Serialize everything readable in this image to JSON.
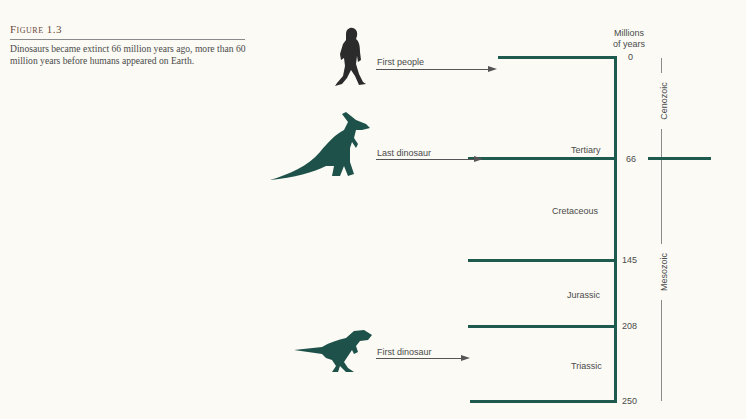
{
  "caption": {
    "title": "Figure 1.3",
    "text": "Dinosaurs became extinct 66 million years ago, more than 60 million years  before humans appeared on Earth."
  },
  "axis": {
    "title_line1": "Millions",
    "title_line2": "of years",
    "ticks": [
      "0",
      "66",
      "145",
      "208",
      "250"
    ]
  },
  "periods": [
    {
      "name": "Tertiary"
    },
    {
      "name": "Cretaceous"
    },
    {
      "name": "Jurassic"
    },
    {
      "name": "Triassic"
    }
  ],
  "eras": [
    {
      "name": "Cenozoic"
    },
    {
      "name": "Mesozoic"
    }
  ],
  "events": [
    {
      "label": "First people",
      "icon": "human-silhouette"
    },
    {
      "label": "Last dinosaur",
      "icon": "hadrosaur-silhouette"
    },
    {
      "label": "First dinosaur",
      "icon": "theropod-silhouette"
    }
  ],
  "colors": {
    "line": "#1f5a4f",
    "silhouette_green": "#1d5149",
    "silhouette_dark": "#2b2b2b",
    "text": "#4a4a4a"
  }
}
